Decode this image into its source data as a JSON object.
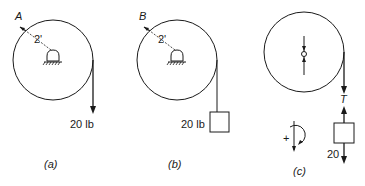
{
  "figure": {
    "panels": [
      {
        "id": "a",
        "caption": "(a)",
        "point_label": "A",
        "radius_label": "2'",
        "load_label": "20 lb",
        "load_type": "force arrow"
      },
      {
        "id": "b",
        "caption": "(b)",
        "point_label": "B",
        "radius_label": "2'",
        "load_label": "20 lb",
        "load_type": "hanging weight block"
      },
      {
        "id": "c",
        "caption": "(c)",
        "tension_label": "T",
        "weight_label": "20",
        "sign_convention_label": "+",
        "load_type": "free body diagram"
      }
    ]
  }
}
